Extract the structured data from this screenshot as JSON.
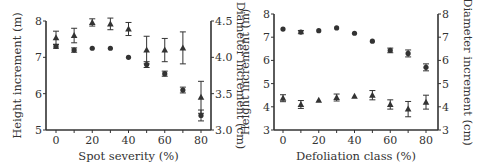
{
  "chart_data": [
    {
      "type": "scatter",
      "xlabel": "Spot severity (%)",
      "ylabel_left": "Height increment (m)",
      "ylabel_right": "Diameter increment (cm)",
      "x_ticks": [
        0,
        20,
        40,
        60,
        80
      ],
      "y_left_ticks": [
        5,
        6,
        7,
        8
      ],
      "y_right_ticks": [
        "3.0",
        "3.5",
        "4.0",
        "4.5"
      ],
      "ylim_left": [
        5,
        8
      ],
      "ylim_right": [
        3.0,
        4.5
      ],
      "xlim": [
        -5,
        85
      ],
      "series": [
        {
          "name": "Height increment",
          "marker": "circle",
          "axis": "left",
          "x": [
            0,
            10,
            20,
            30,
            40,
            50,
            60,
            70,
            80
          ],
          "values": [
            7.3,
            7.2,
            7.25,
            7.25,
            7.0,
            6.8,
            6.55,
            6.1,
            5.4
          ],
          "err": [
            0.05,
            0.06,
            0.0,
            0.0,
            0.0,
            0.08,
            0.07,
            0.08,
            0.15
          ]
        },
        {
          "name": "Diameter increment",
          "marker": "triangle",
          "axis": "right",
          "x": [
            0,
            10,
            20,
            30,
            40,
            50,
            60,
            70,
            80
          ],
          "values": [
            4.27,
            4.3,
            4.48,
            4.46,
            4.39,
            4.1,
            4.1,
            4.13,
            3.45
          ],
          "err": [
            0.09,
            0.1,
            0.05,
            0.08,
            0.09,
            0.19,
            0.16,
            0.22,
            0.22
          ]
        }
      ]
    },
    {
      "type": "scatter",
      "xlabel": "Defoliation class (%)",
      "ylabel_left": "Height increment (m)",
      "ylabel_right": "Diameter increment (cm)",
      "x_ticks": [
        0,
        20,
        40,
        60,
        80
      ],
      "y_left_ticks": [
        3,
        4,
        5,
        6,
        7,
        8
      ],
      "y_right_ticks": [
        3,
        4,
        5,
        6,
        7,
        8
      ],
      "ylim_left": [
        3,
        8
      ],
      "ylim_right": [
        3,
        8
      ],
      "xlim": [
        -5,
        85
      ],
      "series": [
        {
          "name": "Height increment",
          "marker": "circle",
          "axis": "left",
          "x": [
            0,
            10,
            20,
            30,
            40,
            50,
            60,
            70,
            80
          ],
          "values": [
            7.35,
            7.22,
            7.28,
            7.4,
            7.17,
            6.83,
            6.43,
            6.3,
            5.7
          ],
          "err": [
            0.0,
            0.07,
            0.0,
            0.0,
            0.0,
            0.0,
            0.1,
            0.15,
            0.15
          ]
        },
        {
          "name": "Diameter increment",
          "marker": "triangle",
          "axis": "right",
          "x": [
            0,
            10,
            20,
            30,
            40,
            50,
            60,
            70,
            80
          ],
          "values": [
            4.37,
            4.1,
            4.28,
            4.4,
            4.45,
            4.5,
            4.1,
            3.9,
            4.2
          ],
          "err": [
            0.15,
            0.17,
            0.0,
            0.15,
            0.0,
            0.2,
            0.2,
            0.33,
            0.3
          ]
        }
      ]
    }
  ]
}
